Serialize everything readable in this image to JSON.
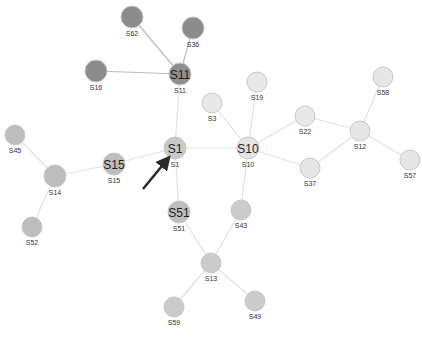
{
  "graph": {
    "nodes": [
      {
        "id": "S62",
        "label": "S62",
        "x": 132,
        "y": 17,
        "r": 11,
        "fill": "#8c8c8c",
        "hub": false
      },
      {
        "id": "S36",
        "label": "S36",
        "x": 193,
        "y": 28,
        "r": 11,
        "fill": "#8c8c8c",
        "hub": false
      },
      {
        "id": "S11",
        "label": "S11",
        "x": 180,
        "y": 74,
        "r": 11,
        "fill": "#8e8e8e",
        "hub": true
      },
      {
        "id": "S16",
        "label": "S16",
        "x": 96,
        "y": 71,
        "r": 11,
        "fill": "#8c8c8c",
        "hub": false
      },
      {
        "id": "S1",
        "label": "S1",
        "x": 175,
        "y": 148,
        "r": 11,
        "fill": "#c9c9c9",
        "hub": true
      },
      {
        "id": "S10",
        "label": "S10",
        "x": 248,
        "y": 148,
        "r": 11,
        "fill": "#e4e4e4",
        "hub": true
      },
      {
        "id": "S3",
        "label": "S3",
        "x": 212,
        "y": 103,
        "r": 10,
        "fill": "#e8e8e8",
        "hub": false
      },
      {
        "id": "S19",
        "label": "S19",
        "x": 257,
        "y": 82,
        "r": 10,
        "fill": "#e8e8e8",
        "hub": false
      },
      {
        "id": "S22",
        "label": "S22",
        "x": 305,
        "y": 116,
        "r": 10,
        "fill": "#e8e8e8",
        "hub": false
      },
      {
        "id": "S12",
        "label": "S12",
        "x": 360,
        "y": 131,
        "r": 10,
        "fill": "#e6e6e6",
        "hub": false
      },
      {
        "id": "S58",
        "label": "S58",
        "x": 383,
        "y": 77,
        "r": 10,
        "fill": "#e6e6e6",
        "hub": false
      },
      {
        "id": "S57",
        "label": "S57",
        "x": 410,
        "y": 160,
        "r": 10,
        "fill": "#e6e6e6",
        "hub": false
      },
      {
        "id": "S37",
        "label": "S37",
        "x": 310,
        "y": 168,
        "r": 10,
        "fill": "#e6e6e6",
        "hub": false
      },
      {
        "id": "S15",
        "label": "S15",
        "x": 114,
        "y": 164,
        "r": 11,
        "fill": "#bdbdbd",
        "hub": true
      },
      {
        "id": "S14",
        "label": "S14",
        "x": 55,
        "y": 176,
        "r": 11,
        "fill": "#bdbdbd",
        "hub": false
      },
      {
        "id": "S45",
        "label": "S45",
        "x": 15,
        "y": 135,
        "r": 10,
        "fill": "#bdbdbd",
        "hub": false
      },
      {
        "id": "S52",
        "label": "S52",
        "x": 32,
        "y": 227,
        "r": 10,
        "fill": "#bdbdbd",
        "hub": false
      },
      {
        "id": "S51",
        "label": "S51",
        "x": 179,
        "y": 212,
        "r": 11,
        "fill": "#bdbdbd",
        "hub": true
      },
      {
        "id": "S43",
        "label": "S43",
        "x": 241,
        "y": 210,
        "r": 10,
        "fill": "#cbcbcb",
        "hub": false
      },
      {
        "id": "S13",
        "label": "S13",
        "x": 211,
        "y": 263,
        "r": 10,
        "fill": "#cbcbcb",
        "hub": false
      },
      {
        "id": "S59",
        "label": "S59",
        "x": 174,
        "y": 307,
        "r": 10,
        "fill": "#cbcbcb",
        "hub": false
      },
      {
        "id": "S49",
        "label": "S49",
        "x": 255,
        "y": 301,
        "r": 10,
        "fill": "#cbcbcb",
        "hub": false
      }
    ],
    "edges": [
      {
        "from": "S62",
        "to": "S11",
        "dark": true
      },
      {
        "from": "S36",
        "to": "S11",
        "dark": true
      },
      {
        "from": "S16",
        "to": "S11",
        "dark": true
      },
      {
        "from": "S11",
        "to": "S1",
        "dark": false
      },
      {
        "from": "S1",
        "to": "S15",
        "dark": false
      },
      {
        "from": "S1",
        "to": "S10",
        "dark": false
      },
      {
        "from": "S1",
        "to": "S51",
        "dark": false
      },
      {
        "from": "S15",
        "to": "S14",
        "dark": false
      },
      {
        "from": "S14",
        "to": "S45",
        "dark": false
      },
      {
        "from": "S14",
        "to": "S52",
        "dark": false
      },
      {
        "from": "S10",
        "to": "S3",
        "dark": false
      },
      {
        "from": "S10",
        "to": "S19",
        "dark": false
      },
      {
        "from": "S10",
        "to": "S22",
        "dark": false
      },
      {
        "from": "S10",
        "to": "S37",
        "dark": false
      },
      {
        "from": "S10",
        "to": "S43",
        "dark": false
      },
      {
        "from": "S22",
        "to": "S12",
        "dark": false
      },
      {
        "from": "S37",
        "to": "S12",
        "dark": false
      },
      {
        "from": "S12",
        "to": "S58",
        "dark": false
      },
      {
        "from": "S12",
        "to": "S57",
        "dark": false
      },
      {
        "from": "S51",
        "to": "S13",
        "dark": false
      },
      {
        "from": "S43",
        "to": "S13",
        "dark": false
      },
      {
        "from": "S13",
        "to": "S59",
        "dark": false
      },
      {
        "from": "S13",
        "to": "S49",
        "dark": false
      }
    ],
    "arrow": {
      "x1": 143,
      "y1": 189,
      "x2": 166,
      "y2": 161,
      "color": "#2a2a2a",
      "target": "S1"
    },
    "colors": {
      "background": "#ffffff",
      "edge": "#e2e2e2",
      "edge_dark": "#bdbdbd",
      "node_stroke": "#c8c8c8"
    }
  }
}
